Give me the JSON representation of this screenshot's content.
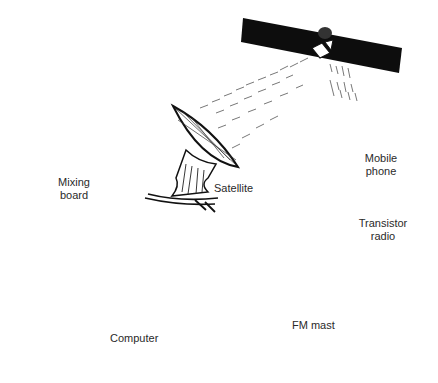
{
  "diagram": {
    "type": "broadcast-flow",
    "nodes": [
      {
        "id": "mixing_board",
        "label_line1": "Mixing",
        "label_line2": "board"
      },
      {
        "id": "satellite_dish",
        "label": "Satellite"
      },
      {
        "id": "satellite",
        "label": ""
      },
      {
        "id": "mobile_phone",
        "label_line1": "Mobile",
        "label_line2": "phone"
      },
      {
        "id": "transistor_radio",
        "label_line1": "Transistor",
        "label_line2": "radio"
      },
      {
        "id": "fm_mast",
        "label": "FM mast"
      },
      {
        "id": "computer",
        "label": "Computer"
      },
      {
        "id": "microphone",
        "label": ""
      }
    ],
    "edges": [
      {
        "from": "microphone",
        "to": "computer"
      },
      {
        "from": "computer",
        "to": "mixing_board"
      },
      {
        "from": "mixing_board",
        "to": "computer"
      },
      {
        "from": "mixing_board",
        "to": "satellite_dish"
      },
      {
        "from": "mixing_board",
        "to": "fm_mast"
      },
      {
        "from": "satellite_dish",
        "to": "satellite"
      },
      {
        "from": "satellite",
        "to": "mobile_phone"
      },
      {
        "from": "fm_mast",
        "to": "transistor_radio"
      }
    ],
    "colors": {
      "ink": "#111111",
      "line": "#444444",
      "screen": "#9a9a9a",
      "radio": "#a8a8a8",
      "mic_head": "#8a8a8a"
    }
  }
}
